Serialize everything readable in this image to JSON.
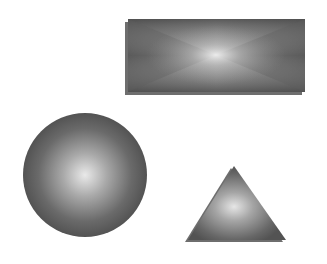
{
  "canvas": {
    "width": 327,
    "height": 264,
    "background": "#ffffff"
  },
  "shapes": {
    "rectangle": {
      "label": "rectangle",
      "x": 128,
      "y": 19,
      "width": 177,
      "height": 73,
      "shadow_offset": [
        -3,
        3
      ],
      "shadow_color": "#6e6e6e",
      "gradient_center": "#e6e6e6",
      "gradient_edge": "#5a5a5a"
    },
    "circle": {
      "label": "circle",
      "cx": 85,
      "cy": 175,
      "r": 62,
      "gradient_center": "#e9e9e9",
      "gradient_edge": "#555555"
    },
    "triangle": {
      "label": "triangle",
      "points": [
        [
          234,
          166
        ],
        [
          188,
          240
        ],
        [
          286,
          240
        ]
      ],
      "shadow_offset": [
        -3,
        2
      ],
      "shadow_color": "#6e6e6e",
      "gradient_center": "#e6e6e6",
      "gradient_edge": "#555555"
    }
  }
}
